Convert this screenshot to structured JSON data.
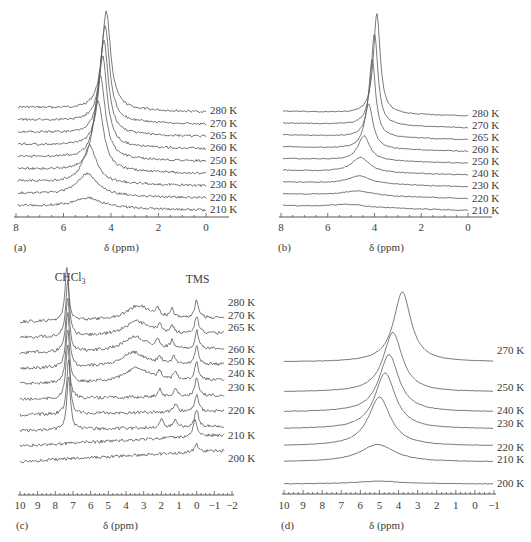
{
  "figure": {
    "panels": [
      "a",
      "b",
      "c",
      "d"
    ]
  },
  "chart_data": [
    {
      "panel": "a",
      "type": "line",
      "subtype": "stacked NMR spectra",
      "panel_label": "(a)",
      "xlabel": "δ (ppm)",
      "ylabel": "",
      "xlim": [
        8,
        0
      ],
      "x_ticks": [
        "8",
        "6",
        "4",
        "2",
        "0"
      ],
      "grid": false,
      "legend": "inline temperature labels at right of each trace",
      "series_note": "Traced visually: peak center, width and height are approximate estimates, not values printed in the figure.",
      "series": [
        {
          "name": "280 K",
          "peak_center_ppm": 4.2,
          "peak_width_ppm": 0.45,
          "relative_height": 1.0
        },
        {
          "name": "270 K",
          "peak_center_ppm": 4.25,
          "peak_width_ppm": 0.45,
          "relative_height": 0.98
        },
        {
          "name": "265 K",
          "peak_center_ppm": 4.3,
          "peak_width_ppm": 0.45,
          "relative_height": 0.95
        },
        {
          "name": "260 K",
          "peak_center_ppm": 4.35,
          "peak_width_ppm": 0.45,
          "relative_height": 0.92
        },
        {
          "name": "250 K",
          "peak_center_ppm": 4.45,
          "peak_width_ppm": 0.5,
          "relative_height": 0.85
        },
        {
          "name": "240 K",
          "peak_center_ppm": 4.55,
          "peak_width_ppm": 0.55,
          "relative_height": 0.72
        },
        {
          "name": "230 K",
          "peak_center_ppm": 4.9,
          "peak_width_ppm": 0.7,
          "relative_height": 0.38
        },
        {
          "name": "220 K",
          "peak_center_ppm": 5.0,
          "peak_width_ppm": 1.0,
          "relative_height": 0.22
        },
        {
          "name": "210 K",
          "peak_center_ppm": 5.0,
          "peak_width_ppm": 1.4,
          "relative_height": 0.1
        }
      ]
    },
    {
      "panel": "b",
      "type": "line",
      "subtype": "stacked NMR spectra",
      "panel_label": "(b)",
      "xlabel": "δ (ppm)",
      "ylabel": "",
      "xlim": [
        8,
        0
      ],
      "x_ticks": [
        "8",
        "6",
        "4",
        "2",
        "0"
      ],
      "grid": false,
      "legend": "inline temperature labels at right of each trace",
      "series_note": "Traced visually: peak center, width and height are approximate estimates, not values printed in the figure.",
      "series": [
        {
          "name": "280 K",
          "peak_center_ppm": 3.9,
          "peak_width_ppm": 0.35,
          "relative_height": 1.0
        },
        {
          "name": "270 K",
          "peak_center_ppm": 4.0,
          "peak_width_ppm": 0.35,
          "relative_height": 0.92
        },
        {
          "name": "265 K",
          "peak_center_ppm": 4.1,
          "peak_width_ppm": 0.35,
          "relative_height": 0.78
        },
        {
          "name": "260 K",
          "peak_center_ppm": 4.25,
          "peak_width_ppm": 0.45,
          "relative_height": 0.45
        },
        {
          "name": "250 K",
          "peak_center_ppm": 4.45,
          "peak_width_ppm": 0.6,
          "relative_height": 0.25
        },
        {
          "name": "240 K",
          "peak_center_ppm": 4.6,
          "peak_width_ppm": 0.9,
          "relative_height": 0.15
        },
        {
          "name": "230 K",
          "peak_center_ppm": 4.65,
          "peak_width_ppm": 1.2,
          "relative_height": 0.08
        },
        {
          "name": "220 K",
          "peak_center_ppm": 4.7,
          "peak_width_ppm": 1.5,
          "relative_height": 0.05
        },
        {
          "name": "210 K",
          "peak_center_ppm": 5.1,
          "peak_width_ppm": 1.8,
          "relative_height": 0.03
        }
      ]
    },
    {
      "panel": "c",
      "type": "line",
      "subtype": "stacked NMR spectra",
      "panel_label": "(c)",
      "xlabel": "δ (ppm)",
      "ylabel": "",
      "xlim": [
        10,
        -2
      ],
      "x_ticks": [
        "10",
        "9",
        "8",
        "7",
        "6",
        "5",
        "4",
        "3",
        "2",
        "1",
        "0",
        "−1",
        "−2"
      ],
      "grid": false,
      "annotations": [
        {
          "text": "CHCl",
          "subscript": "3",
          "x_ppm": 7.3
        },
        {
          "text": "TMS",
          "x_ppm": 0.0
        }
      ],
      "legend": "inline temperature labels at right of each trace",
      "series_note": "Traced visually: peak positions, widths and heights are approximate estimates, not values printed in the figure.",
      "series": [
        {
          "name": "280 K",
          "peaks_ppm": [
            7.35,
            3.3,
            2.2,
            1.4,
            0.0
          ]
        },
        {
          "name": "270 K",
          "peaks_ppm": [
            7.3,
            3.4,
            2.1,
            1.4,
            0.0
          ]
        },
        {
          "name": "265 K",
          "peaks_ppm": [
            7.3,
            3.5,
            2.2,
            1.4,
            0.0
          ]
        },
        {
          "name": "260 K",
          "peaks_ppm": [
            7.3,
            3.6,
            2.1,
            1.3,
            0.0
          ]
        },
        {
          "name": "250 K",
          "peaks_ppm": [
            7.3,
            3.4,
            2.1,
            1.2,
            0.0
          ]
        },
        {
          "name": "240 K",
          "peaks_ppm": [
            7.3,
            2.1,
            1.2,
            0.0
          ]
        },
        {
          "name": "230 K",
          "peaks_ppm": [
            7.25,
            1.2,
            0.0
          ]
        },
        {
          "name": "220 K",
          "peaks_ppm": [
            7.25,
            2.0,
            1.2,
            0.0
          ]
        },
        {
          "name": "210 K",
          "peaks_ppm": [
            0.1
          ]
        },
        {
          "name": "200 K",
          "peaks_ppm": [
            0.0
          ]
        }
      ]
    },
    {
      "panel": "d",
      "type": "line",
      "subtype": "stacked NMR spectra",
      "panel_label": "(d)",
      "xlabel": "δ (ppm)",
      "ylabel": "",
      "xlim": [
        10,
        -1
      ],
      "x_ticks": [
        "10",
        "9",
        "8",
        "7",
        "6",
        "5",
        "4",
        "3",
        "2",
        "1",
        "0",
        "−1"
      ],
      "grid": false,
      "legend": "inline temperature labels at right of each trace",
      "series_note": "Traced visually: peak center, width and height are approximate estimates, not values printed in the figure.",
      "series": [
        {
          "name": "270 K",
          "peak_center_ppm": 3.8,
          "peak_width_ppm": 1.1,
          "relative_height": 1.0
        },
        {
          "name": "250 K",
          "peak_center_ppm": 4.3,
          "peak_width_ppm": 1.2,
          "relative_height": 0.85
        },
        {
          "name": "240 K",
          "peak_center_ppm": 4.5,
          "peak_width_ppm": 1.25,
          "relative_height": 0.82
        },
        {
          "name": "230 K",
          "peak_center_ppm": 4.7,
          "peak_width_ppm": 1.3,
          "relative_height": 0.8
        },
        {
          "name": "220 K",
          "peak_center_ppm": 5.0,
          "peak_width_ppm": 1.4,
          "relative_height": 0.7
        },
        {
          "name": "210 K",
          "peak_center_ppm": 5.1,
          "peak_width_ppm": 2.2,
          "relative_height": 0.25
        },
        {
          "name": "200 K",
          "peak_center_ppm": 5.0,
          "peak_width_ppm": 3.0,
          "relative_height": 0.04
        }
      ]
    }
  ]
}
